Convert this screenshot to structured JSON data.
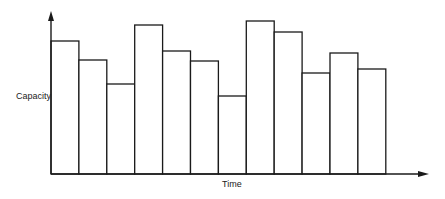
{
  "chart_data": {
    "type": "bar",
    "title": "",
    "xlabel": "Time",
    "ylabel": "Capacity",
    "categories": [
      "1",
      "2",
      "3",
      "4",
      "5",
      "6",
      "7",
      "8",
      "9",
      "10",
      "11",
      "12"
    ],
    "values": [
      133,
      114,
      90,
      149,
      123,
      113,
      78,
      153,
      142,
      101,
      121,
      105
    ],
    "value_units": "relative height (no numeric scale shown)",
    "ylim": [
      0,
      162
    ],
    "grid": false,
    "legend": null,
    "bar_style": {
      "fill": "#ffffff",
      "stroke": "#1a1a1a",
      "adjacent": true
    },
    "axes": {
      "arrows": true,
      "x_ticks": [],
      "y_ticks": []
    }
  },
  "geometry": {
    "origin_x": 51,
    "baseline_y": 174,
    "bar_width": 27.9,
    "y_arrow_top": 12,
    "x_arrow_tip": 428
  }
}
